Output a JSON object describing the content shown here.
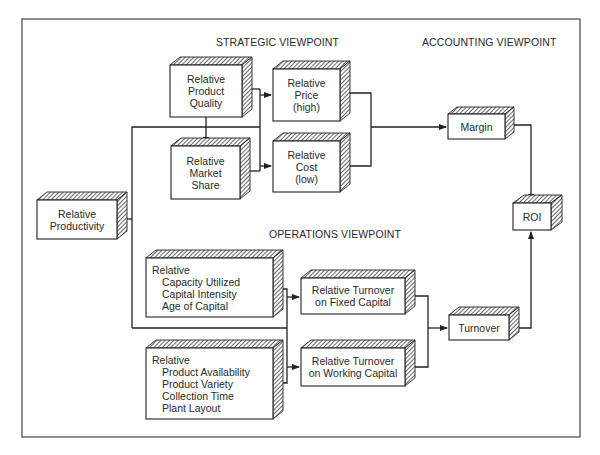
{
  "diagram": {
    "headings": {
      "strategic": "STRATEGIC VIEWPOINT",
      "accounting": "ACCOUNTING VIEWPOINT",
      "operations": "OPERATIONS VIEWPOINT"
    },
    "nodes": {
      "product_quality": {
        "lines": [
          "Relative",
          "Product",
          "Quality"
        ]
      },
      "market_share": {
        "lines": [
          "Relative",
          "Market",
          "Share"
        ]
      },
      "price": {
        "lines": [
          "Relative",
          "Price",
          "(high)"
        ]
      },
      "cost": {
        "lines": [
          "Relative",
          "Cost",
          "(low)"
        ]
      },
      "margin": {
        "lines": [
          "Margin"
        ]
      },
      "roi": {
        "lines": [
          "ROI"
        ]
      },
      "productivity": {
        "lines": [
          "Relative",
          "Productivity"
        ]
      },
      "capacity": {
        "lines": [
          "Relative",
          "Capacity Utilized",
          "Capital Intensity",
          "Age of Capital"
        ]
      },
      "product_factors": {
        "lines": [
          "Relative",
          "Product Availability",
          "Product Variety",
          "Collection Time",
          "Plant Layout"
        ]
      },
      "turnover_fixed": {
        "lines": [
          "Relative Turnover",
          "on Fixed Capital"
        ]
      },
      "turnover_working": {
        "lines": [
          "Relative Turnover",
          "on Working Capital"
        ]
      },
      "turnover": {
        "lines": [
          "Turnover"
        ]
      }
    },
    "edges": [
      [
        "product_quality",
        "market_share"
      ],
      [
        "product_quality",
        "price"
      ],
      [
        "product_quality",
        "cost"
      ],
      [
        "market_share",
        "price"
      ],
      [
        "market_share",
        "cost"
      ],
      [
        "productivity",
        "price"
      ],
      [
        "productivity",
        "cost"
      ],
      [
        "price",
        "margin"
      ],
      [
        "cost",
        "margin"
      ],
      [
        "margin",
        "roi"
      ],
      [
        "productivity",
        "turnover_fixed"
      ],
      [
        "productivity",
        "turnover_working"
      ],
      [
        "capacity",
        "turnover_fixed"
      ],
      [
        "capacity",
        "turnover_working"
      ],
      [
        "product_factors",
        "turnover_fixed"
      ],
      [
        "product_factors",
        "turnover_working"
      ],
      [
        "turnover_fixed",
        "turnover"
      ],
      [
        "turnover_working",
        "turnover"
      ],
      [
        "turnover",
        "roi"
      ]
    ]
  }
}
